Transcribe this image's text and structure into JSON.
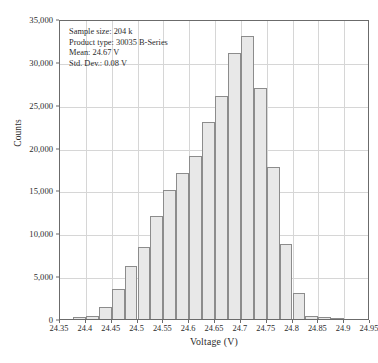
{
  "chart_data": {
    "type": "bar",
    "title": "",
    "subtitle": "",
    "xlabel": "Voltage (V)",
    "ylabel": "Counts",
    "xlim": [
      24.35,
      24.95
    ],
    "ylim": [
      0,
      35000
    ],
    "grid": true,
    "legend_position": "none",
    "bin_width": 0.025,
    "x_tick_labels": [
      "24.35",
      "24.4",
      "24.45",
      "24.5",
      "24.55",
      "24.6",
      "24.65",
      "24.7",
      "24.75",
      "24.8",
      "24.85",
      "24.9",
      "24.95"
    ],
    "x_tick_values": [
      24.35,
      24.4,
      24.45,
      24.5,
      24.55,
      24.6,
      24.65,
      24.7,
      24.75,
      24.8,
      24.85,
      24.9,
      24.95
    ],
    "y_tick_labels": [
      "0",
      "5,000",
      "10,000",
      "15,000",
      "20,000",
      "25,000",
      "30,000",
      "35,000"
    ],
    "y_tick_values": [
      0,
      5000,
      10000,
      15000,
      20000,
      25000,
      30000,
      35000
    ],
    "bin_edges": [
      24.375,
      24.4,
      24.425,
      24.45,
      24.475,
      24.5,
      24.525,
      24.55,
      24.575,
      24.6,
      24.625,
      24.65,
      24.675,
      24.7,
      24.725,
      24.75,
      24.775,
      24.8,
      24.825,
      24.85,
      24.875,
      24.9
    ],
    "categories": [
      "24.375",
      "24.400",
      "24.425",
      "24.450",
      "24.475",
      "24.500",
      "24.525",
      "24.550",
      "24.575",
      "24.600",
      "24.625",
      "24.650",
      "24.675",
      "24.700",
      "24.725",
      "24.750",
      "24.775",
      "24.800",
      "24.825",
      "24.850",
      "24.875"
    ],
    "values": [
      200,
      300,
      1400,
      3500,
      6200,
      8400,
      12000,
      15000,
      17000,
      19000,
      23000,
      26000,
      31000,
      33000,
      27000,
      17700,
      8800,
      3000,
      300,
      200,
      150
    ]
  },
  "annotation": {
    "sample_size": "Sample size: 204 k",
    "product_type": "Product type: 30035 B-Series",
    "mean": "Mean: 24.67 V",
    "std_dev": "Std. Dev.: 0.08 V"
  },
  "colors": {
    "bar_fill": "#e8e8e8",
    "bar_stroke": "#8c8c8c",
    "grid": "#d6d6d6",
    "axis": "#6b6b6b",
    "text": "#2b2b2b"
  }
}
